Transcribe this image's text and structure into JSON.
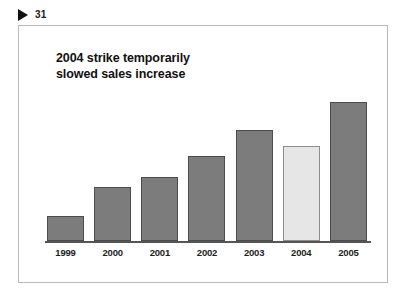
{
  "page_marker": {
    "icon": "play-triangle-icon",
    "number": "31"
  },
  "chart_title": {
    "line1": "2004 strike temporarily",
    "line2": "slowed sales increase"
  },
  "colors": {
    "bar_fill": "#7c7c7c",
    "bar_border": "#4c4c4c",
    "highlight_fill": "#e6e6e6",
    "highlight_border": "#8d8d8d",
    "axis": "#555555",
    "frame_border": "#b9b9b9",
    "text": "#111111"
  },
  "chart_data": {
    "type": "bar",
    "title": "2004 strike temporarily slowed sales increase",
    "xlabel": "",
    "ylabel": "",
    "grid": false,
    "legend": "none",
    "ylim": [
      0,
      100
    ],
    "categories": [
      "1999",
      "2000",
      "2001",
      "2002",
      "2003",
      "2004",
      "2005"
    ],
    "values": [
      15,
      33,
      39,
      52,
      68,
      58,
      85
    ],
    "bar_heights_px": [
      25,
      54,
      64,
      85,
      111,
      95,
      139
    ],
    "highlight_index": 5,
    "highlight_note": "2004 bar shown in light gray to mark the strike year",
    "annotations": []
  }
}
